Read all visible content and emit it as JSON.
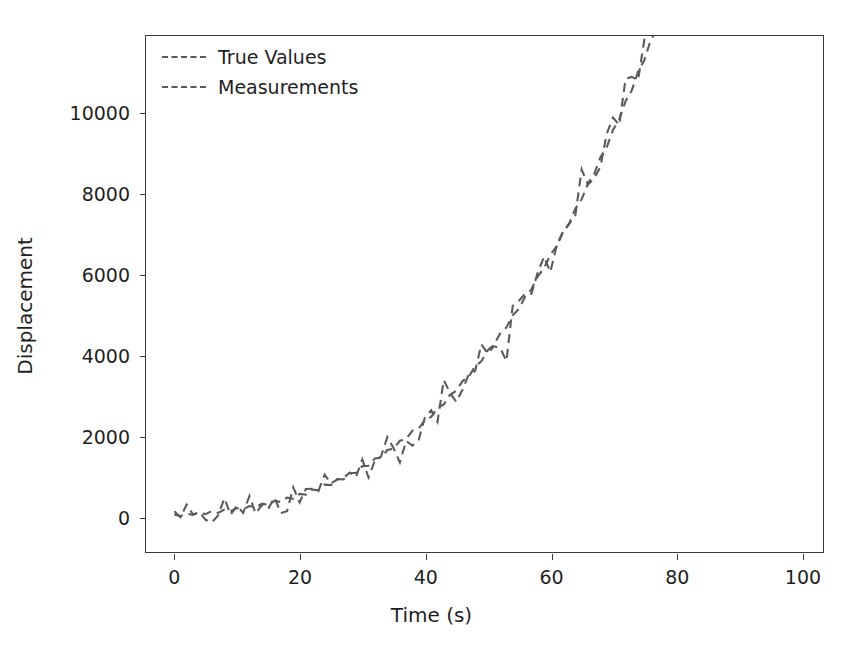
{
  "chart_data": {
    "type": "line",
    "title": "",
    "xlabel": "Time (s)",
    "ylabel": "Displacement",
    "xlim": [
      -4.5,
      103.5
    ],
    "ylim": [
      -900,
      11900
    ],
    "grid": false,
    "legend_position": "upper left",
    "xticks": [
      0,
      20,
      40,
      60,
      80,
      100
    ],
    "xtick_labels": [
      "0",
      "20",
      "40",
      "60",
      "80",
      "100"
    ],
    "yticks": [
      0,
      2000,
      4000,
      6000,
      8000,
      10000
    ],
    "ytick_labels": [
      "0",
      "2000",
      "4000",
      "6000",
      "8000",
      "10000"
    ],
    "line_color": "#5b5b5b",
    "line_style": "dashed",
    "x": [
      0,
      1,
      2,
      3,
      4,
      5,
      6,
      7,
      8,
      9,
      10,
      11,
      12,
      13,
      14,
      15,
      16,
      17,
      18,
      19,
      20,
      21,
      22,
      23,
      24,
      25,
      26,
      27,
      28,
      29,
      30,
      31,
      32,
      33,
      34,
      35,
      36,
      37,
      38,
      39,
      40,
      41,
      42,
      43,
      44,
      45,
      46,
      47,
      48,
      49,
      50,
      51,
      52,
      53,
      54,
      55,
      56,
      57,
      58,
      59,
      60,
      61,
      62,
      63,
      64,
      65,
      66,
      67,
      68,
      69,
      70,
      71,
      72,
      73,
      74,
      75,
      76,
      77,
      78,
      79,
      80,
      81,
      82,
      83,
      84,
      85,
      86,
      87,
      88,
      89,
      90,
      91,
      92,
      93,
      94,
      95,
      96,
      97,
      98
    ],
    "series": [
      {
        "name": "True Values",
        "values": [
          0,
          11,
          45,
          101,
          180,
          281,
          405,
          551,
          720,
          911,
          1125,
          1361,
          1620,
          1901,
          2205,
          2531,
          2880,
          3251,
          3645,
          4061,
          4500,
          4961,
          5445,
          5951,
          6480,
          7031,
          7605,
          8201,
          8820,
          9461,
          10125,
          10811,
          11520,
          12251,
          13005,
          13781,
          14580,
          15401,
          16245,
          17111,
          18000,
          18911,
          19845,
          20801,
          21780,
          22781,
          23805,
          24851,
          25920,
          27011,
          28125,
          29261,
          30420,
          31601,
          32805,
          34031,
          35280,
          36551,
          37845,
          39161,
          40500,
          41861,
          43245,
          44651,
          46080,
          47531,
          49005,
          50501,
          52020,
          53561,
          55125,
          56711,
          58320,
          59951,
          61605,
          63281,
          64980,
          66701,
          68445,
          70211,
          72000,
          73811,
          75645,
          77501,
          79380,
          81281,
          83205,
          85151,
          87120,
          89111,
          91125,
          93161,
          95220,
          97301,
          99405,
          101531,
          103680,
          105851,
          108045
        ]
      },
      {
        "name": "Measurements",
        "values": [
          0,
          11,
          45,
          101,
          180,
          281,
          405,
          551,
          720,
          911,
          1125,
          1361,
          1620,
          1901,
          2205,
          2531,
          2880,
          3251,
          3645,
          4061,
          4500,
          4961,
          5445,
          5951,
          6480,
          7031,
          7605,
          8201,
          8820,
          9461,
          10125,
          10811,
          11520,
          12251,
          13005,
          13781,
          14580,
          15401,
          16245,
          17111,
          18000,
          18911,
          19845,
          20801,
          21780,
          22781,
          23805,
          24851,
          25920,
          27011,
          28125,
          29261,
          30420,
          31601,
          32805,
          34031,
          35280,
          36551,
          37845,
          39161,
          40500,
          41861,
          43245,
          44651,
          46080,
          47531,
          49005,
          50501,
          52020,
          53561,
          55125,
          56711,
          58320,
          59951,
          61605,
          63281,
          64980,
          66701,
          68445,
          70211,
          72000,
          73811,
          75645,
          77501,
          79380,
          81281,
          83205,
          85151,
          87120,
          89111,
          91125,
          93161,
          95220,
          97301,
          99405,
          101531,
          103680,
          105851,
          108045
        ]
      }
    ],
    "true_values": [
      30,
      -10,
      50,
      20,
      80,
      40,
      120,
      70,
      150,
      110,
      190,
      160,
      240,
      210,
      300,
      270,
      370,
      340,
      450,
      420,
      540,
      520,
      650,
      630,
      770,
      760,
      910,
      900,
      1060,
      1060,
      1230,
      1240,
      1420,
      1440,
      1630,
      1660,
      1860,
      1900,
      2110,
      2160,
      2380,
      2450,
      2680,
      2760,
      3000,
      3100,
      3340,
      3450,
      3710,
      3830,
      4100,
      4240,
      4520,
      4670,
      4970,
      5130,
      5440,
      5620,
      5940,
      6140,
      6470,
      6680,
      7030,
      7250,
      7620,
      7850,
      8240,
      8480,
      8890,
      9140,
      9570,
      9830,
      10280,
      10550,
      11020,
      11300,
      11790,
      12080,
      12590,
      12890,
      13420,
      13730,
      14280,
      14600,
      15170,
      15500,
      16090,
      16430,
      17040,
      17390,
      18020,
      18380,
      19030,
      19400,
      20070,
      20450,
      21140,
      21530,
      22240
    ],
    "measurements_noise_sigma": 420
  },
  "axes": {
    "xlabel": "Time (s)",
    "ylabel": "Displacement"
  },
  "legend": {
    "entries": [
      {
        "label": "True Values"
      },
      {
        "label": "Measurements"
      }
    ]
  }
}
